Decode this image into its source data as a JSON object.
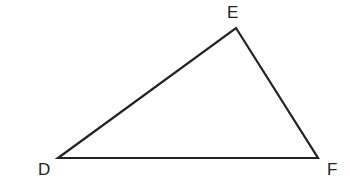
{
  "diagram": {
    "type": "triangle",
    "stroke_color": "#222222",
    "vertices": [
      {
        "label": "D",
        "x": 58,
        "y": 158
      },
      {
        "label": "E",
        "x": 236,
        "y": 28
      },
      {
        "label": "F",
        "x": 318,
        "y": 158
      }
    ],
    "labels": {
      "d": "D",
      "e": "E",
      "f": "F"
    }
  }
}
